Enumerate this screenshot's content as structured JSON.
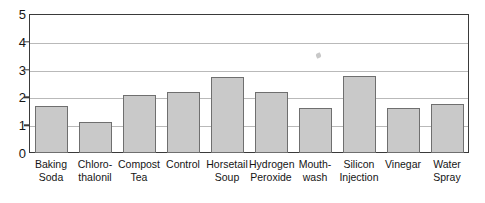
{
  "chart_data": {
    "type": "bar",
    "title": "",
    "subtitle": "",
    "xlabel": "",
    "ylabel": "",
    "ylim": [
      0,
      5
    ],
    "yticks": [
      0,
      1,
      2,
      3,
      4,
      5
    ],
    "ytick_labels": [
      "0",
      "1",
      "2",
      "3",
      "4",
      "5"
    ],
    "grid": true,
    "gridlines_at": [
      1,
      2,
      3,
      4
    ],
    "legend": null,
    "legend_position": "none",
    "categories": [
      "Baking Soda",
      "Chloro-thalonil",
      "Compost Tea",
      "Control",
      "Horsetail Soup",
      "Hydrogen Peroxide",
      "Mouth-wash",
      "Silicon Injection",
      "Vinegar",
      "Water Spray"
    ],
    "category_lines": [
      [
        "Baking",
        "Soda"
      ],
      [
        "Chloro-",
        "thalonil"
      ],
      [
        "Compost",
        "Tea"
      ],
      [
        "Control",
        ""
      ],
      [
        "Horsetail",
        "Soup"
      ],
      [
        "Hydrogen",
        "Peroxide"
      ],
      [
        "Mouth-",
        "wash"
      ],
      [
        "Silicon",
        "Injection"
      ],
      [
        "Vinegar",
        ""
      ],
      [
        "Water",
        "Spray"
      ]
    ],
    "values": [
      1.68,
      1.12,
      2.1,
      2.21,
      2.74,
      2.18,
      1.62,
      2.77,
      1.63,
      1.76
    ],
    "bar_fill_color": "#c9c9c9",
    "bar_edge_color": "#6f6f6f",
    "grid_color": "#b9b9b9",
    "axis_color": "#3a3a3a",
    "text_color": "#151515"
  }
}
